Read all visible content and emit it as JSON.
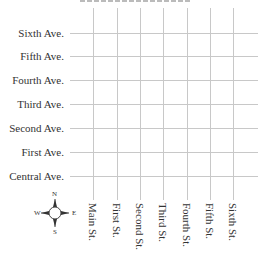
{
  "diagram": {
    "type": "street-grid-map",
    "avenues": [
      {
        "label": "Sixth Ave.",
        "y": 33
      },
      {
        "label": "Fifth Ave.",
        "y": 56
      },
      {
        "label": "Fourth Ave.",
        "y": 80
      },
      {
        "label": "Third Ave.",
        "y": 104
      },
      {
        "label": "Second Ave.",
        "y": 128
      },
      {
        "label": "First Ave.",
        "y": 152
      },
      {
        "label": "Central Ave.",
        "y": 176
      }
    ],
    "streets": [
      {
        "label": "Main St.",
        "x": 93
      },
      {
        "label": "First St.",
        "x": 117
      },
      {
        "label": "Second St.",
        "x": 140
      },
      {
        "label": "Third St.",
        "x": 163
      },
      {
        "label": "Fourth St.",
        "x": 187
      },
      {
        "label": "Fifth St.",
        "x": 210
      },
      {
        "label": "Sixth St.",
        "x": 233
      }
    ],
    "compass": {
      "n": "N",
      "s": "S",
      "e": "E",
      "w": "W"
    },
    "colors": {
      "grid": "#c8c8c8",
      "text": "#333333"
    }
  }
}
